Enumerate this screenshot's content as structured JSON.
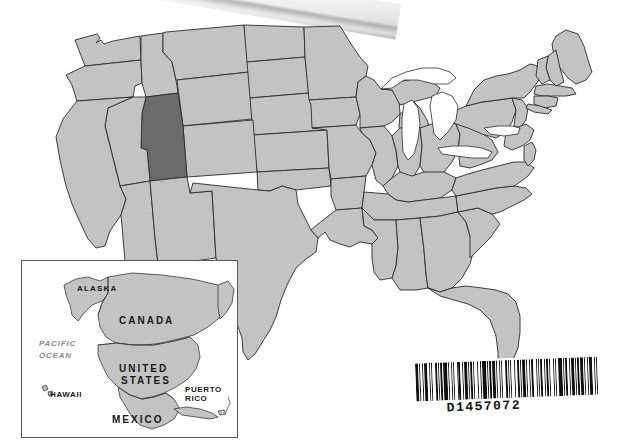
{
  "document": {
    "type": "scanned-map-page",
    "background_color": "#ffffff"
  },
  "map": {
    "title": "United States",
    "projection_note": "contiguous 48 states",
    "state_fill_color": "#c3c3c3",
    "highlight_fill_color": "#6b6b6b",
    "border_color": "#2b2b2b",
    "water_fill_color": "#ffffff",
    "highlighted_state": "Utah",
    "great_lakes_unfilled": true
  },
  "inset": {
    "title": "North America locator",
    "border_color": "#5a5a5a",
    "land_fill_color": "#c3c3c3",
    "ocean_color": "#ffffff",
    "labels": [
      {
        "id": "alaska",
        "text": "ALASKA"
      },
      {
        "id": "canada",
        "text": "CANADA"
      },
      {
        "id": "pacific",
        "text": "PACIFIC"
      },
      {
        "id": "ocean",
        "text": "OCEAN"
      },
      {
        "id": "united",
        "text": "UNITED"
      },
      {
        "id": "states",
        "text": "STATES"
      },
      {
        "id": "hawaii",
        "text": "HAWAII"
      },
      {
        "id": "puerto",
        "text": "PUERTO"
      },
      {
        "id": "rico",
        "text": "RICO"
      },
      {
        "id": "mexico",
        "text": "MEXICO"
      }
    ]
  },
  "barcode": {
    "value": "D1457072",
    "symbology_appearance": "code-39-like",
    "bar_color": "#111111",
    "background_color": "#ffffff",
    "rotation_degrees": -2.2,
    "pattern": [
      3,
      1,
      1,
      2,
      1,
      1,
      3,
      2,
      1,
      1,
      1,
      3,
      2,
      1,
      1,
      1,
      2,
      1,
      4,
      1,
      1,
      2,
      1,
      1,
      1,
      3,
      1,
      1,
      2,
      2,
      1,
      1,
      3,
      1,
      1,
      1,
      2,
      1,
      1,
      3,
      1,
      2,
      1,
      1,
      4,
      1,
      1,
      1,
      2,
      1,
      3,
      1,
      1,
      2,
      1,
      1,
      1,
      3,
      2,
      1,
      1,
      1,
      1,
      3,
      1,
      2,
      2,
      1,
      1,
      1,
      3,
      1,
      1,
      2,
      1,
      1,
      2,
      3,
      1,
      1,
      1,
      1,
      3,
      2,
      1,
      1,
      2,
      1,
      1,
      3,
      1,
      1,
      1,
      2,
      4,
      1,
      1,
      1,
      2,
      2,
      1,
      1,
      3,
      1,
      1,
      1,
      2,
      1,
      3,
      1,
      1,
      2,
      1,
      1,
      3,
      2,
      1,
      1,
      1,
      3
    ]
  },
  "artifact": {
    "description": "scanned paper edge with shadow at top of page",
    "present": true
  }
}
